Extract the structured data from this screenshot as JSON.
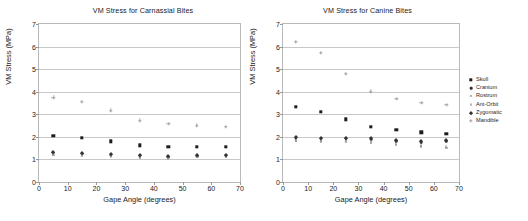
{
  "figure": {
    "axis_titles": {
      "x": "Gape Angle (degrees)",
      "y": "VM Stress (MPa)"
    }
  },
  "legend": {
    "entries": [
      {
        "label": "Skull",
        "marker": "square",
        "color": "#1d1d1d"
      },
      {
        "label": "Cranium",
        "marker": "dot",
        "color": "#2b2b2b"
      },
      {
        "label": "Rostrum",
        "marker": "tiny",
        "color": "#adadad"
      },
      {
        "label": "Ant-Orbit",
        "marker": "tri",
        "color": "#8d8d8d"
      },
      {
        "label": "Zygomatic",
        "marker": "diamond",
        "color": "#333333"
      },
      {
        "label": "Mandible",
        "marker": "plus",
        "color": "#9d9d9d"
      }
    ]
  },
  "chart_data": [
    {
      "id": "carnassial",
      "type": "scatter",
      "title": "VM Stress for Carnassial Bites",
      "xlabel": "Gape Angle (degrees)",
      "ylabel": "VM Stress (MPa)",
      "xlim": [
        0,
        70
      ],
      "ylim": [
        0,
        7
      ],
      "xticks": [
        0,
        10,
        20,
        30,
        40,
        50,
        60,
        70
      ],
      "yticks": [
        0,
        1,
        2,
        3,
        4,
        5,
        6,
        7
      ],
      "grid": "horizontal",
      "legend_position": "right-outside",
      "x": [
        5,
        15,
        25,
        35,
        45,
        55,
        65
      ],
      "series": [
        {
          "name": "Skull",
          "marker": "square",
          "values": [
            2.05,
            1.97,
            1.8,
            1.63,
            1.56,
            1.57,
            1.56
          ]
        },
        {
          "name": "Cranium",
          "marker": "dot",
          "values": [
            1.29,
            1.25,
            1.2,
            1.14,
            1.1,
            1.15,
            1.18
          ]
        },
        {
          "name": "Rostrum",
          "marker": "tiny",
          "values": [
            1.21,
            1.18,
            1.14,
            1.08,
            1.05,
            1.1,
            1.12
          ]
        },
        {
          "name": "Ant-Orbit",
          "marker": "tri",
          "values": [
            1.26,
            1.22,
            1.17,
            1.11,
            1.08,
            1.13,
            1.15
          ]
        },
        {
          "name": "Zygomatic",
          "marker": "diamond",
          "values": [
            1.33,
            1.28,
            1.23,
            1.18,
            1.13,
            1.18,
            1.2
          ]
        },
        {
          "name": "Mandible",
          "marker": "plus",
          "values": [
            3.75,
            3.56,
            3.17,
            2.73,
            2.57,
            2.52,
            2.45
          ]
        }
      ]
    },
    {
      "id": "canine",
      "type": "scatter",
      "title": "VM Stress for Canine Bites",
      "xlabel": "Gape Angle (degrees)",
      "ylabel": "VM Stress (MPa)",
      "xlim": [
        0,
        70
      ],
      "ylim": [
        0,
        7
      ],
      "xticks": [
        0,
        10,
        20,
        30,
        40,
        50,
        60,
        70
      ],
      "yticks": [
        0,
        1,
        2,
        3,
        4,
        5,
        6,
        7
      ],
      "grid": "horizontal",
      "legend_position": "right-outside",
      "x": [
        5,
        15,
        25,
        35,
        45,
        55,
        65
      ],
      "series": [
        {
          "name": "Skull",
          "marker": "square",
          "values": [
            3.32,
            3.12,
            2.78,
            2.45,
            2.3,
            2.21,
            2.14
          ]
        },
        {
          "name": "Cranium",
          "marker": "dot",
          "values": [
            1.95,
            1.92,
            1.93,
            1.88,
            1.8,
            1.74,
            1.8
          ]
        },
        {
          "name": "Rostrum",
          "marker": "tiny",
          "values": [
            1.82,
            1.8,
            1.8,
            1.72,
            1.66,
            1.58,
            1.5
          ]
        },
        {
          "name": "Ant-Orbit",
          "marker": "tri",
          "values": [
            1.88,
            1.86,
            1.86,
            1.8,
            1.72,
            1.64,
            1.58
          ]
        },
        {
          "name": "Zygomatic",
          "marker": "diamond",
          "values": [
            2.0,
            1.97,
            1.97,
            1.93,
            1.86,
            1.8,
            1.86
          ]
        },
        {
          "name": "Mandible",
          "marker": "plus",
          "values": [
            6.2,
            5.73,
            4.78,
            4.02,
            3.68,
            3.52,
            3.42
          ]
        }
      ]
    }
  ]
}
